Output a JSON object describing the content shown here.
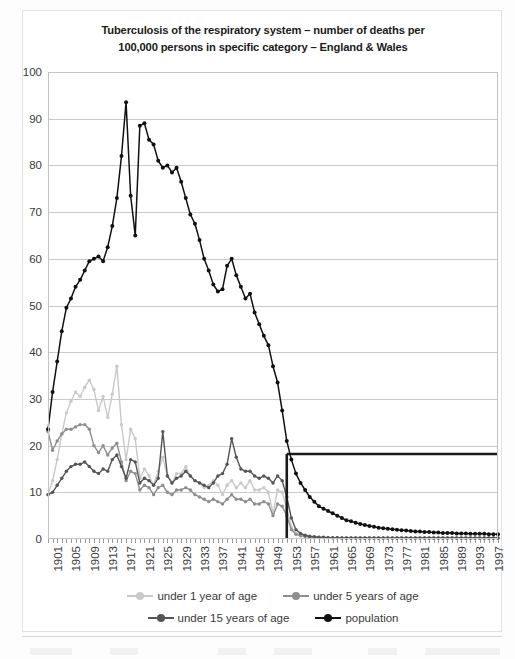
{
  "chart_data": {
    "type": "line",
    "title": "Tuberculosis of the respiratory system – number of deaths per 100,000  persons in specific category – England & Wales",
    "title_line1": "Tuberculosis of the respiratory system – number of deaths per",
    "title_line2": "100,000  persons in specific category – England & Wales",
    "xlabel": "",
    "ylabel": "",
    "ylim": [
      0,
      100
    ],
    "ytick_step": 10,
    "yticks": [
      0,
      10,
      20,
      30,
      40,
      50,
      60,
      70,
      80,
      90,
      100
    ],
    "grid": true,
    "legend_position": "bottom",
    "x_start": 1901,
    "x_end": 1999,
    "xtick_labels": [
      "1901",
      "1905",
      "1909",
      "1913",
      "1917",
      "1921",
      "1925",
      "1929",
      "1933",
      "1937",
      "1941",
      "1945",
      "1949",
      "1953",
      "1957",
      "1961",
      "1965",
      "1969",
      "1973",
      "1977",
      "1981",
      "1985",
      "1989",
      "1993",
      "1997"
    ],
    "x": [
      1901,
      1902,
      1903,
      1904,
      1905,
      1906,
      1907,
      1908,
      1909,
      1910,
      1911,
      1912,
      1913,
      1914,
      1915,
      1916,
      1917,
      1918,
      1919,
      1920,
      1921,
      1922,
      1923,
      1924,
      1925,
      1926,
      1927,
      1928,
      1929,
      1930,
      1931,
      1932,
      1933,
      1934,
      1935,
      1936,
      1937,
      1938,
      1939,
      1940,
      1941,
      1942,
      1943,
      1944,
      1945,
      1946,
      1947,
      1948,
      1949,
      1950,
      1951,
      1952,
      1953,
      1954,
      1955,
      1956,
      1957,
      1958,
      1959,
      1960,
      1961,
      1962,
      1963,
      1964,
      1965,
      1966,
      1967,
      1968,
      1969,
      1970,
      1971,
      1972,
      1973,
      1974,
      1975,
      1976,
      1977,
      1978,
      1979,
      1980,
      1981,
      1982,
      1983,
      1984,
      1985,
      1986,
      1987,
      1988,
      1989,
      1990,
      1991,
      1992,
      1993,
      1994,
      1995,
      1996,
      1997,
      1998,
      1999
    ],
    "series": [
      {
        "name": "under 1 year of age",
        "color": "#c9c9c9",
        "values": [
          9.5,
          12.5,
          17.0,
          22.5,
          27.0,
          29.5,
          31.5,
          30.5,
          32.5,
          34.0,
          32.0,
          27.5,
          30.5,
          26.0,
          31.0,
          37.0,
          24.5,
          17.0,
          23.5,
          21.5,
          13.0,
          15.0,
          13.5,
          11.5,
          14.5,
          17.5,
          13.5,
          12.0,
          14.0,
          14.0,
          15.5,
          13.5,
          12.5,
          12.0,
          11.0,
          11.5,
          12.5,
          11.5,
          9.5,
          11.5,
          12.5,
          11.0,
          12.0,
          11.0,
          12.5,
          10.5,
          10.5,
          11.0,
          10.0,
          5.5,
          10.5,
          10.0,
          6.5,
          2.5,
          1.2,
          0.8,
          0.6,
          0.5,
          0.4,
          0.4,
          0.3,
          0.3,
          0.3,
          0.3,
          0.2,
          0.2,
          0.2,
          0.2,
          0.2,
          0.2,
          0.2,
          0.2,
          0.2,
          0.2,
          0.2,
          0.2,
          0.2,
          0.2,
          0.2,
          0.2,
          0.2,
          0.2,
          0.2,
          0.2,
          0.2,
          0.2,
          0.2,
          0.2,
          0.2,
          0.2,
          0.2,
          0.2,
          0.2,
          0.2,
          0.2,
          0.2,
          0.2,
          0.2,
          0.2
        ]
      },
      {
        "name": "under 5 years of age",
        "color": "#8e8e8e",
        "values": [
          23.0,
          19.0,
          21.0,
          22.5,
          23.5,
          23.5,
          24.0,
          24.5,
          24.5,
          23.5,
          20.0,
          18.5,
          20.0,
          18.0,
          19.5,
          20.5,
          16.5,
          12.5,
          14.5,
          14.0,
          10.5,
          11.5,
          11.0,
          9.5,
          11.0,
          11.5,
          10.0,
          9.5,
          10.5,
          10.5,
          11.0,
          10.5,
          9.5,
          9.0,
          8.5,
          8.0,
          8.5,
          8.0,
          7.5,
          8.5,
          9.5,
          8.5,
          8.5,
          8.0,
          8.5,
          7.5,
          7.5,
          8.0,
          7.5,
          5.0,
          7.5,
          7.0,
          5.0,
          2.0,
          1.0,
          0.7,
          0.5,
          0.4,
          0.4,
          0.3,
          0.3,
          0.3,
          0.2,
          0.2,
          0.2,
          0.2,
          0.2,
          0.2,
          0.2,
          0.2,
          0.2,
          0.2,
          0.2,
          0.2,
          0.2,
          0.2,
          0.2,
          0.2,
          0.2,
          0.2,
          0.2,
          0.2,
          0.2,
          0.2,
          0.2,
          0.2,
          0.2,
          0.2,
          0.2,
          0.2,
          0.2,
          0.2,
          0.2,
          0.2,
          0.2,
          0.2,
          0.2,
          0.2,
          0.2
        ]
      },
      {
        "name": "under 15 years of age",
        "color": "#555555",
        "values": [
          9.5,
          10.0,
          11.5,
          13.0,
          14.5,
          15.5,
          16.0,
          16.0,
          16.5,
          15.5,
          14.5,
          14.0,
          15.0,
          14.5,
          17.0,
          18.0,
          15.5,
          13.0,
          17.0,
          16.5,
          12.0,
          13.0,
          12.5,
          11.5,
          13.0,
          23.0,
          13.5,
          12.0,
          13.0,
          13.5,
          14.5,
          13.5,
          12.5,
          12.0,
          11.5,
          11.0,
          12.0,
          13.5,
          14.0,
          16.0,
          21.5,
          17.5,
          15.0,
          14.5,
          14.5,
          13.5,
          13.0,
          13.5,
          13.0,
          12.0,
          13.5,
          12.5,
          9.0,
          4.5,
          2.0,
          1.2,
          0.8,
          0.6,
          0.5,
          0.4,
          0.4,
          0.3,
          0.3,
          0.3,
          0.2,
          0.2,
          0.2,
          0.2,
          0.2,
          0.2,
          0.2,
          0.2,
          0.2,
          0.2,
          0.2,
          0.2,
          0.2,
          0.2,
          0.2,
          0.2,
          0.2,
          0.2,
          0.2,
          0.2,
          0.2,
          0.2,
          0.2,
          0.2,
          0.2,
          0.2,
          0.2,
          0.2,
          0.2,
          0.2,
          0.2,
          0.2,
          0.2,
          0.2,
          0.2
        ]
      },
      {
        "name": "population",
        "color": "#111111",
        "values": [
          23.5,
          31.5,
          38.0,
          44.5,
          49.5,
          51.5,
          54.0,
          55.5,
          57.5,
          59.5,
          60.0,
          60.5,
          59.5,
          62.5,
          67.0,
          73.0,
          82.0,
          93.5,
          73.5,
          65.0,
          88.5,
          89.0,
          85.5,
          84.5,
          81.0,
          79.5,
          80.0,
          78.5,
          79.5,
          76.5,
          73.0,
          69.5,
          67.5,
          64.0,
          60.0,
          57.5,
          54.5,
          53.0,
          53.5,
          58.5,
          60.0,
          56.5,
          54.0,
          51.5,
          52.5,
          48.5,
          46.0,
          43.5,
          41.5,
          37.0,
          33.5,
          27.5,
          21.0,
          17.0,
          14.0,
          12.0,
          10.5,
          9.0,
          8.0,
          7.0,
          6.5,
          6.0,
          5.5,
          5.0,
          4.5,
          4.0,
          3.8,
          3.5,
          3.2,
          3.0,
          2.8,
          2.6,
          2.4,
          2.3,
          2.2,
          2.1,
          2.0,
          1.9,
          1.8,
          1.7,
          1.6,
          1.6,
          1.5,
          1.5,
          1.4,
          1.4,
          1.3,
          1.3,
          1.3,
          1.2,
          1.2,
          1.2,
          1.1,
          1.1,
          1.1,
          1.1,
          1.0,
          1.0,
          1.0
        ]
      }
    ],
    "annotations": [
      {
        "name": "bcg-vaccination-marker-horizontal",
        "type": "hline",
        "y": 18.2,
        "x_from": 1953,
        "x_to": 1999,
        "color": "#1a1a1a"
      },
      {
        "name": "bcg-vaccination-marker-vertical",
        "type": "vline",
        "x": 1953,
        "y_from": 0,
        "y_to": 18.2,
        "color": "#1a1a1a"
      }
    ]
  },
  "legend": {
    "items": [
      {
        "label": "under 1 year of age",
        "color": "#c9c9c9"
      },
      {
        "label": "under 5 years of age",
        "color": "#8e8e8e"
      },
      {
        "label": "under 15 years of age",
        "color": "#555555"
      },
      {
        "label": "population",
        "color": "#111111"
      }
    ]
  }
}
